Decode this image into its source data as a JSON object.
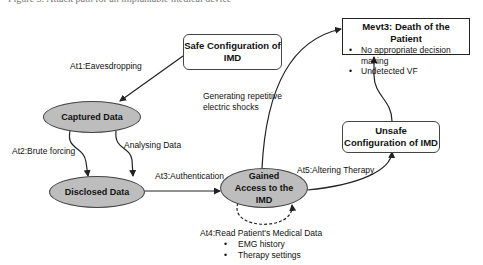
{
  "caption": "Figure 3: Attack path for an implantable medical device",
  "nodes": {
    "safe_config": "Safe Configuration of IMD",
    "captured_data": "Captured Data",
    "disclosed_data": "Disclosed Data",
    "gained_access": "Gained Access to the IMD",
    "unsafe_config": "Unsafe Configuration of IMD",
    "mevt3": {
      "title": "Mevt3: Death of the Patient",
      "bullets": [
        "No appropriate decision making",
        "Undetected VF"
      ]
    }
  },
  "edges": {
    "at1": "At1:Eavesdropping",
    "at2": "At2:Brute forcing",
    "analysing": "Analysing Data",
    "at3": "At3:Authentication",
    "generating": "Generating repetitive electric shocks",
    "at5": "At5:Altering Therapy",
    "at4": {
      "title": "At4:Read Patient's Medical Data",
      "bullets": [
        "EMG history",
        "Therapy settings"
      ]
    }
  },
  "colors": {
    "ellipse_fill": "#bdbdbd",
    "stroke": "#333333",
    "background": "#ffffff"
  }
}
